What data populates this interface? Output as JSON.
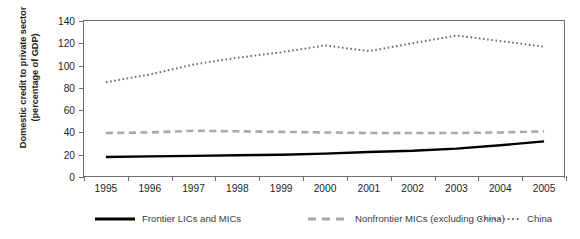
{
  "chart_data": {
    "type": "line",
    "title": "",
    "xlabel": "",
    "ylabel": "Domestic credit to private sector (percentage of GDP)",
    "ylabel_line1": "Domestic credit to private sector",
    "ylabel_line2": "(percentage of GDP)",
    "categories": [
      "1995",
      "1996",
      "1997",
      "1998",
      "1999",
      "2000",
      "2001",
      "2002",
      "2003",
      "2004",
      "2005"
    ],
    "x": [
      1995,
      1996,
      1997,
      1998,
      1999,
      2000,
      2001,
      2002,
      2003,
      2004,
      2005
    ],
    "ylim": [
      0,
      140
    ],
    "yticks": [
      0,
      20,
      40,
      60,
      80,
      100,
      120,
      140
    ],
    "grid": false,
    "legend_position": "bottom",
    "series": [
      {
        "name": "Frontier LICs and MICs",
        "style": "solid",
        "color": "#000000",
        "values": [
          18,
          18.5,
          19,
          19.5,
          20,
          21,
          22.5,
          23.5,
          25.5,
          28.5,
          32
        ]
      },
      {
        "name": "Nonfrontier MICs (excluding China)",
        "style": "dashed",
        "color": "#a6a8ab",
        "values": [
          39.5,
          40,
          41.5,
          41,
          40.5,
          40,
          39.5,
          39.5,
          39.5,
          40,
          41
        ]
      },
      {
        "name": "China",
        "style": "dotted",
        "color": "#6d6e70",
        "values": [
          85,
          92,
          101,
          107,
          112,
          118,
          113,
          120,
          127,
          122,
          117
        ]
      }
    ]
  },
  "legend": {
    "items": [
      {
        "label": "Frontier LICs and MICs",
        "marker": "solid-line-marker"
      },
      {
        "label": "Nonfrontier MICs (excluding China)",
        "marker": "dashed-line-marker"
      },
      {
        "label": "China",
        "marker": "dotted-line-marker"
      }
    ]
  }
}
